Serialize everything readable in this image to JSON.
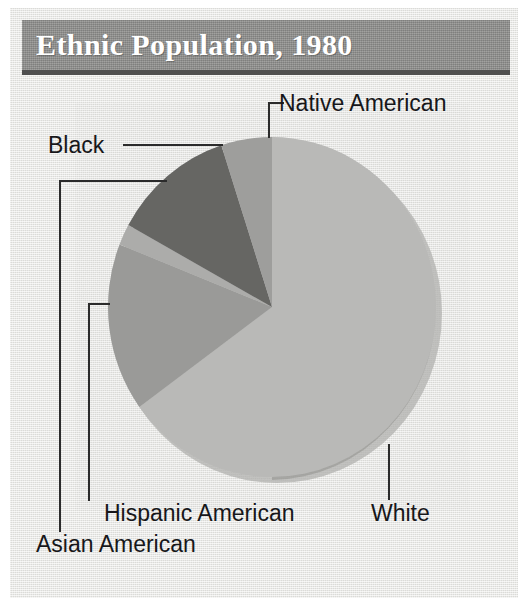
{
  "figure": {
    "title": "Ethnic Population, 1980"
  },
  "chart_data": {
    "type": "pie",
    "title": "Ethnic Population, 1980",
    "subtitle": "",
    "xlabel": "",
    "ylabel": "",
    "legend_position": "callout-labels",
    "grid": false,
    "start_angle_deg": 0,
    "direction": "clockwise",
    "categories": [
      "White",
      "Hispanic American",
      "Asian American",
      "Black",
      "Native American"
    ],
    "values": [
      65,
      16,
      2,
      12,
      5
    ],
    "slices": [
      {
        "label": "White",
        "value": 65,
        "color": "#b9b9b7",
        "start_deg": 0,
        "end_deg": 234
      },
      {
        "label": "Hispanic American",
        "value": 16,
        "color": "#9a9a98",
        "start_deg": 234,
        "end_deg": 292
      },
      {
        "label": "Asian American",
        "value": 2,
        "color": "#acacaa",
        "start_deg": 292,
        "end_deg": 299
      },
      {
        "label": "Black",
        "value": 12,
        "color": "#666664",
        "start_deg": 299,
        "end_deg": 342
      },
      {
        "label": "Native American",
        "value": 5,
        "color": "#9e9e9c",
        "start_deg": 342,
        "end_deg": 360
      }
    ]
  },
  "labels": {
    "native_american": "Native American",
    "black": "Black",
    "hispanic_american": "Hispanic American",
    "asian_american": "Asian American",
    "white": "White"
  },
  "colors": {
    "title_bar": "#8e8e8c",
    "title_text": "#ffffff",
    "background": "#e7e7e4",
    "leader_line": "#2b2b2b",
    "label_text": "#17171a"
  }
}
